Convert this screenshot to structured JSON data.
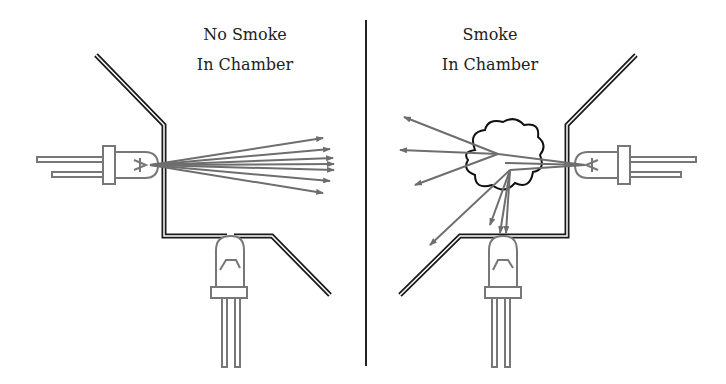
{
  "left_panel": {
    "title_line1": "No Smoke",
    "title_line2": "In Chamber"
  },
  "right_panel": {
    "title_line1": "Smoke",
    "title_line2": "In Chamber"
  },
  "colors": {
    "wall": "#1a1a1a",
    "component": "#777777",
    "ray": "#6e6e6e",
    "divider": "#222222"
  }
}
